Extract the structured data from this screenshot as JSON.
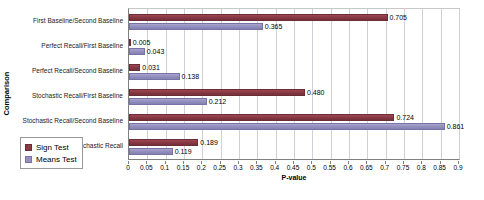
{
  "chart_data": {
    "type": "bar",
    "orientation": "horizontal",
    "title": "",
    "xlabel": "P-value",
    "ylabel": "Comparison",
    "xlim": [
      0,
      0.9
    ],
    "xtick_step": 0.05,
    "grid": true,
    "legend_position": "bottom-left",
    "categories": [
      "First Baseline/Second Baseline",
      "Perfect Recall/First Baseline",
      "Perfect Recall/Second Baseline",
      "Stochastic Recall/First Baseline",
      "Stochastic Recall/Second Baseline",
      "Perfect Recall/Stochastic Recall"
    ],
    "xticks": [
      "0",
      "0.05",
      "0.1",
      "0.15",
      "0.2",
      "0.25",
      "0.3",
      "0.35",
      "0.4",
      "0.45",
      "0.5",
      "0.55",
      "0.6",
      "0.65",
      "0.7",
      "0.75",
      "0.8",
      "0.85",
      "0.9"
    ],
    "xtick_values": [
      0,
      0.05,
      0.1,
      0.15,
      0.2,
      0.25,
      0.3,
      0.35,
      0.4,
      0.45,
      0.5,
      0.55,
      0.6,
      0.65,
      0.7,
      0.75,
      0.8,
      0.85,
      0.9
    ],
    "series": [
      {
        "name": "Sign Test",
        "color": "#8b3a44",
        "values": [
          0.705,
          0.005,
          0.031,
          0.48,
          0.724,
          0.189
        ],
        "labels": [
          "0.705",
          "0.005",
          "0.031",
          "0.480",
          "0.724",
          "0.189"
        ]
      },
      {
        "name": "Means Test",
        "color": "#9490c0",
        "values": [
          0.365,
          0.043,
          0.138,
          0.212,
          0.861,
          0.119
        ],
        "labels": [
          "0.365",
          "0.043",
          "0.138",
          "0.212",
          "0.861",
          "0.119"
        ]
      }
    ]
  },
  "legend": {
    "items": [
      {
        "label": "Sign Test"
      },
      {
        "label": "Means Test"
      }
    ]
  },
  "axes": {
    "x_title": "P-value",
    "y_title": "Comparison"
  }
}
